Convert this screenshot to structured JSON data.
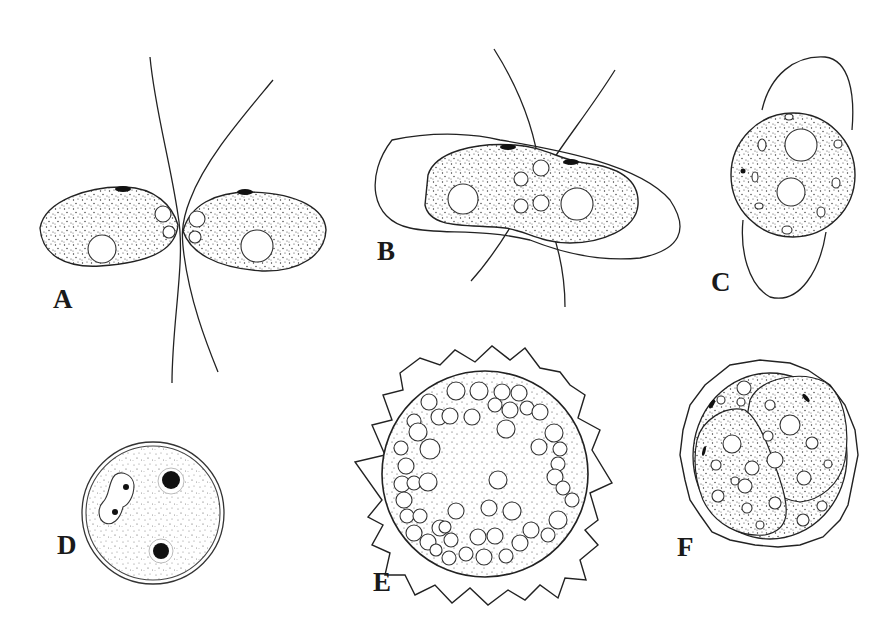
{
  "figure": {
    "panels": [
      {
        "id": "A",
        "label": "A",
        "description": "Two ovoid biflagellate cells joined at their anterior ends, flagella crossing"
      },
      {
        "id": "B",
        "label": "B",
        "description": "Fused elongated cell within an outer envelope, four flagella"
      },
      {
        "id": "C",
        "label": "C",
        "description": "Rounded cell with two nuclei inside an elongated envelope"
      },
      {
        "id": "D",
        "label": "D",
        "description": "Spherical zygote with dark bodies and a dumbbell-shaped nucleus"
      },
      {
        "id": "E",
        "label": "E",
        "description": "Spiny-walled zygote filled with many vacuoles"
      },
      {
        "id": "F",
        "label": "F",
        "description": "Germinating zygote with daughter cells inside an irregular wall"
      }
    ]
  }
}
